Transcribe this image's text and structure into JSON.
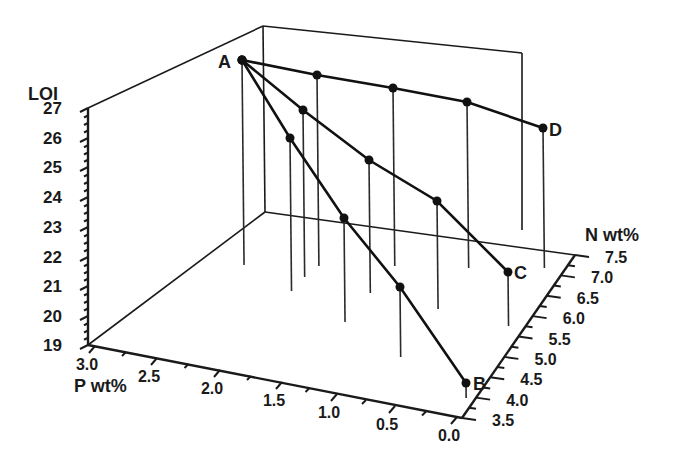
{
  "chart_data": {
    "type": "scatter",
    "subtype": "3d-line-with-droplines",
    "title": "",
    "axes": {
      "z": {
        "label": "LOI",
        "ticks": [
          "19",
          "20",
          "21",
          "22",
          "23",
          "24",
          "25",
          "26",
          "27"
        ],
        "range": [
          19,
          27
        ]
      },
      "x": {
        "label": "P wt%",
        "ticks": [
          "3.0",
          "2.5",
          "2.0",
          "1.5",
          "1.0",
          "0.5",
          "0.0"
        ],
        "range": [
          3.0,
          0.0
        ]
      },
      "y": {
        "label": "N wt%",
        "ticks": [
          "3.5",
          "4.0",
          "4.5",
          "5.0",
          "5.5",
          "6.0",
          "6.5",
          "7.0",
          "7.5"
        ],
        "range": [
          3.5,
          7.5
        ]
      }
    },
    "grid": false,
    "legend": null,
    "series": [
      {
        "name": "A-B",
        "points": [
          {
            "label": "A",
            "P": 2.7,
            "N": 6.1,
            "LOI": 26.9
          },
          {
            "label": "",
            "P": 2.0,
            "N": 5.6,
            "LOI": 24.6
          },
          {
            "label": "",
            "P": 1.3,
            "N": 5.0,
            "LOI": 22.4
          },
          {
            "label": "",
            "P": 0.7,
            "N": 4.4,
            "LOI": 21.2
          },
          {
            "label": "B",
            "P": 0.1,
            "N": 3.6,
            "LOI": 19.5
          }
        ]
      },
      {
        "name": "A-C",
        "points": [
          {
            "label": "A",
            "P": 2.7,
            "N": 6.1,
            "LOI": 26.9
          },
          {
            "label": "",
            "P": 2.1,
            "N": 6.2,
            "LOI": 25.5
          },
          {
            "label": "",
            "P": 1.5,
            "N": 6.3,
            "LOI": 23.8
          },
          {
            "label": "",
            "P": 0.9,
            "N": 6.4,
            "LOI": 22.5
          },
          {
            "label": "C",
            "P": 0.3,
            "N": 6.5,
            "LOI": 20.8
          }
        ]
      },
      {
        "name": "A-D",
        "points": [
          {
            "label": "A",
            "P": 2.7,
            "N": 6.1,
            "LOI": 26.9
          },
          {
            "label": "",
            "P": 2.2,
            "N": 6.6,
            "LOI": 26.5
          },
          {
            "label": "",
            "P": 1.6,
            "N": 7.0,
            "LOI": 26.0
          },
          {
            "label": "",
            "P": 1.0,
            "N": 7.3,
            "LOI": 25.4
          },
          {
            "label": "D",
            "P": 0.5,
            "N": 7.5,
            "LOI": 24.3
          }
        ]
      }
    ],
    "point_labels": [
      "A",
      "B",
      "C",
      "D"
    ]
  },
  "render": {
    "box": {
      "floor": [
        [
          88,
          345
        ],
        [
          265,
          212
        ],
        [
          575,
          255
        ],
        [
          462,
          418
        ]
      ],
      "back_top": [
        [
          88,
          108
        ],
        [
          263,
          26
        ],
        [
          522,
          53
        ]
      ],
      "back_vertical": [
        [
          263,
          26
        ],
        [
          265,
          212
        ]
      ],
      "right_vertical": [
        [
          522,
          53
        ],
        [
          522,
          230
        ]
      ]
    },
    "z_axis": {
      "from": [
        88,
        108
      ],
      "to": [
        88,
        345
      ],
      "ticks": [
        {
          "t": "27",
          "y": 108
        },
        {
          "t": "26",
          "y": 138
        },
        {
          "t": "25",
          "y": 167
        },
        {
          "t": "24",
          "y": 197
        },
        {
          "t": "23",
          "y": 227
        },
        {
          "t": "22",
          "y": 257
        },
        {
          "t": "21",
          "y": 286
        },
        {
          "t": "20",
          "y": 316
        },
        {
          "t": "19",
          "y": 345
        }
      ]
    },
    "p_axis": {
      "ticks": [
        {
          "t": "3.0",
          "x": 95,
          "y": 346
        },
        {
          "t": "2.5",
          "x": 157,
          "y": 358
        },
        {
          "t": "2.0",
          "x": 220,
          "y": 370
        },
        {
          "t": "1.5",
          "x": 282,
          "y": 382
        },
        {
          "t": "1.0",
          "x": 337,
          "y": 394
        },
        {
          "t": "0.5",
          "x": 395,
          "y": 406
        },
        {
          "t": "0.0",
          "x": 457,
          "y": 417
        }
      ]
    },
    "n_axis": {
      "ticks": [
        {
          "t": "3.5",
          "x": 492,
          "y": 418
        },
        {
          "t": "4.0",
          "x": 503,
          "y": 397
        },
        {
          "t": "4.5",
          "x": 514,
          "y": 376
        },
        {
          "t": "5.0",
          "x": 524,
          "y": 355
        },
        {
          "t": "5.5",
          "x": 534,
          "y": 334
        },
        {
          "t": "6.0",
          "x": 545,
          "y": 313
        },
        {
          "t": "6.5",
          "x": 556,
          "y": 292
        },
        {
          "t": "7.0",
          "x": 566,
          "y": 273
        },
        {
          "t": "7.5",
          "x": 576,
          "y": 255
        }
      ]
    },
    "lines": [
      [
        [
          242,
          60
        ],
        [
          290,
          138
        ],
        [
          344,
          218
        ],
        [
          400,
          287
        ],
        [
          466,
          383
        ]
      ],
      [
        [
          242,
          60
        ],
        [
          303,
          110
        ],
        [
          369,
          160
        ],
        [
          437,
          201
        ],
        [
          508,
          272
        ]
      ],
      [
        [
          242,
          60
        ],
        [
          317,
          75
        ],
        [
          393,
          88
        ],
        [
          467,
          102
        ],
        [
          543,
          128
        ]
      ]
    ],
    "drops": [
      [
        242,
        60,
        265
      ],
      [
        290,
        138,
        291
      ],
      [
        344,
        218,
        322
      ],
      [
        400,
        287,
        357
      ],
      [
        466,
        383,
        398
      ],
      [
        303,
        110,
        277
      ],
      [
        369,
        160,
        293
      ],
      [
        437,
        201,
        309
      ],
      [
        508,
        272,
        326
      ],
      [
        317,
        75,
        266
      ],
      [
        393,
        88,
        266
      ],
      [
        467,
        102,
        268
      ],
      [
        543,
        128,
        268
      ]
    ],
    "labels": [
      {
        "t": "A",
        "x": 218,
        "y": 68
      },
      {
        "t": "B",
        "x": 473,
        "y": 390
      },
      {
        "t": "C",
        "x": 514,
        "y": 279
      },
      {
        "t": "D",
        "x": 549,
        "y": 136
      }
    ],
    "axis_titles": [
      {
        "t": "LOI",
        "x": 28,
        "y": 100
      },
      {
        "t": "P wt%",
        "x": 74,
        "y": 392
      },
      {
        "t": "N wt%",
        "x": 585,
        "y": 241
      }
    ]
  }
}
